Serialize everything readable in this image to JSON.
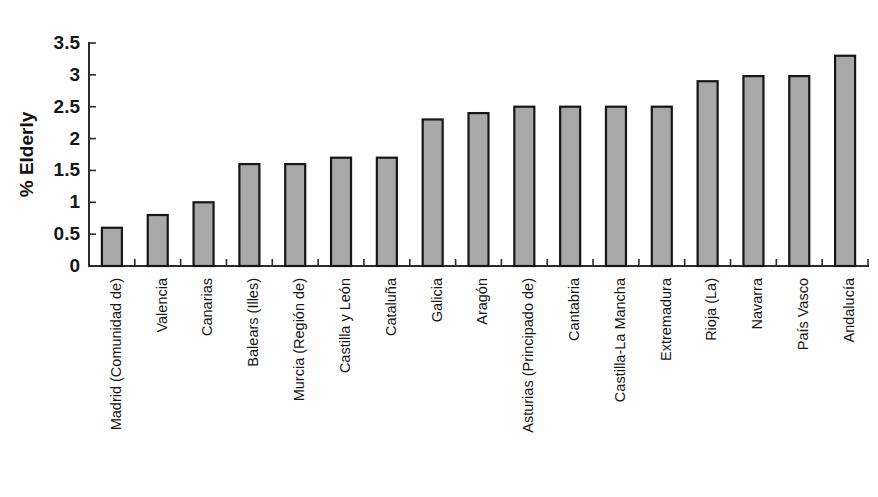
{
  "chart_data": {
    "type": "bar",
    "title": "",
    "subtitle": "",
    "xlabel": "",
    "ylabel": "% Elderly",
    "ylim": [
      0,
      3.5
    ],
    "ytick_labels": [
      "0",
      "0.5",
      "1",
      "1.5",
      "2",
      "2.5",
      "3",
      "3.5"
    ],
    "ytick_values": [
      0,
      0.5,
      1,
      1.5,
      2,
      2.5,
      3,
      3.5
    ],
    "grid": false,
    "legend": false,
    "legend_position": "none",
    "bar_fill_color": "#a8a8a8",
    "bar_edge_color": "#161616",
    "axis_color": "#2b2b2b",
    "background_color": "#fefefe",
    "categories": [
      "Madrid (Comunidad de)",
      "Valencia",
      "Canarias",
      "Balears (Illes)",
      "Murcia (Región de)",
      "Castilla y León",
      "Cataluña",
      "Galicia",
      "Aragón",
      "Asturias (Principado de)",
      "Cantabria",
      "Castilla-La Mancha",
      "Extremadura",
      "Rioja (La)",
      "Navarra",
      "País Vasco",
      "Andalucía"
    ],
    "values": [
      0.6,
      0.8,
      1.0,
      1.6,
      1.6,
      1.7,
      1.7,
      2.3,
      2.4,
      2.5,
      2.5,
      2.5,
      2.5,
      2.9,
      2.98,
      2.98,
      3.3
    ]
  }
}
